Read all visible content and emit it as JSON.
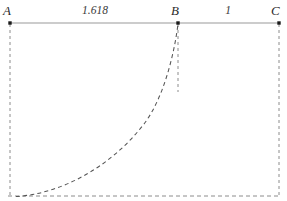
{
  "figure": {
    "background_color": "#ffffff"
  },
  "points": [
    {
      "id": "A",
      "label": "A",
      "x": 10,
      "y": 23,
      "label_x": 3,
      "label_y": 4
    },
    {
      "id": "B",
      "label": "B",
      "x": 178,
      "y": 23,
      "label_x": 171,
      "label_y": 4
    },
    {
      "id": "C",
      "label": "C",
      "x": 279,
      "y": 23,
      "label_x": 272,
      "label_y": 4
    }
  ],
  "segment_labels": [
    {
      "id": "AB",
      "text": "1.618",
      "x": 95,
      "y": 5
    },
    {
      "id": "BC",
      "text": "1",
      "x": 228,
      "y": 5
    }
  ],
  "axis": {
    "baseline_top_y": 23,
    "baseline_bottom_y": 196,
    "left_x": 10,
    "right_x": 279,
    "solid_line_color": "#9a9a9a",
    "dashed_line_color": "#8c8c8c",
    "curve_color": "#555555",
    "point_color": "#1a1a1a"
  },
  "curve": {
    "type": "exponential-dashed",
    "description": "dashed curve rising from baseline near A up to point B",
    "start": {
      "x": 18,
      "y": 196
    },
    "end": {
      "x": 178,
      "y": 23
    },
    "dash_pattern": "4 3"
  },
  "dashed_verticals": [
    {
      "from_point": "A",
      "x": 10,
      "y_top": 24,
      "y_bottom": 196
    },
    {
      "from_point": "B",
      "x": 178,
      "y_top": 24,
      "y_bottom": 90
    },
    {
      "from_point": "C",
      "x": 279,
      "y_top": 24,
      "y_bottom": 196
    }
  ],
  "dashed_baseline": {
    "x_start": 8,
    "x_end": 281,
    "y": 196
  }
}
